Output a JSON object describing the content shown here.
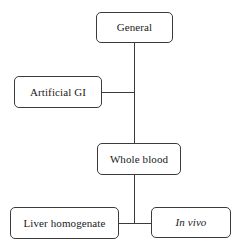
{
  "diagram": {
    "colors": {
      "background": "#ffffff",
      "node_border": "#3b3b3b",
      "node_fill": "#ffffff",
      "edge": "#3b3b3b",
      "text": "#1a1a1a"
    },
    "nodes": [
      {
        "id": "general",
        "label": "General",
        "style": "normal",
        "shape": "rounded-rectangle"
      },
      {
        "id": "artificial_gi",
        "label": "Artificial GI",
        "style": "normal",
        "shape": "rounded-rectangle"
      },
      {
        "id": "whole_blood",
        "label": "Whole blood",
        "style": "normal",
        "shape": "rounded-rectangle"
      },
      {
        "id": "liver_homogenate",
        "label": "Liver homogenate",
        "style": "normal",
        "shape": "rounded-rectangle"
      },
      {
        "id": "in_vivo",
        "label": "In vivo",
        "style": "italic",
        "shape": "rounded-rectangle"
      }
    ],
    "edges": [
      {
        "id": "general-to-whole-blood",
        "from": "general",
        "to": "whole_blood",
        "orientation": "vertical"
      },
      {
        "id": "artificial-gi-to-trunk",
        "from": "artificial_gi",
        "to": "trunk",
        "orientation": "horizontal"
      },
      {
        "id": "whole-blood-to-bottom-bus",
        "from": "whole_blood",
        "to": "bottom_bus",
        "orientation": "vertical"
      },
      {
        "id": "bottom-bus-left",
        "from": "bottom_bus",
        "to": "liver_homogenate",
        "orientation": "horizontal"
      },
      {
        "id": "bottom-bus-right",
        "from": "bottom_bus",
        "to": "in_vivo",
        "orientation": "horizontal"
      }
    ]
  }
}
